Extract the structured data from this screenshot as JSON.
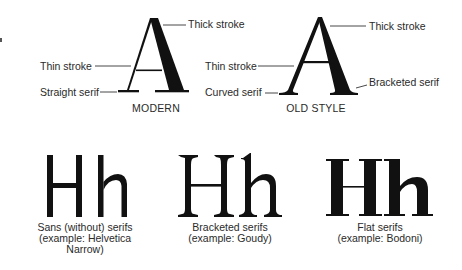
{
  "diagram": {
    "modern": {
      "title": "MODERN",
      "glyph": "A",
      "labels": {
        "thick_stroke": "Thick stroke",
        "thin_stroke": "Thin stroke",
        "straight_serif": "Straight serif"
      }
    },
    "old_style": {
      "title": "OLD STYLE",
      "glyph": "A",
      "labels": {
        "thick_stroke": "Thick stroke",
        "thin_stroke": "Thin stroke",
        "curved_serif": "Curved serif",
        "bracketed_serif": "Bracketed serif"
      }
    },
    "examples": [
      {
        "glyphs": "Hh",
        "caption": "Sans (without) serifs\n(example: Helvetica\nNarrow)"
      },
      {
        "glyphs": "Hh",
        "caption": "Bracketed serifs\n(example: Goudy)"
      },
      {
        "glyphs": "Hh",
        "caption": "Flat serifs\n(example: Bodoni)"
      }
    ],
    "colors": {
      "ink": "#111111",
      "text": "#2a2a2a",
      "leader": "#333333",
      "background": "#ffffff"
    }
  }
}
